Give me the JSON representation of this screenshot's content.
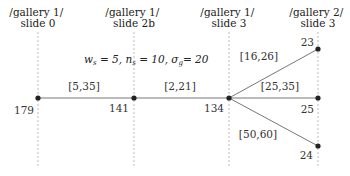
{
  "columns": [
    {
      "line1": "/gallery 1/",
      "line2": "slide 0",
      "x": 38
    },
    {
      "line1": "/gallery 1/",
      "line2": "slide 2b",
      "x": 134
    },
    {
      "line1": "/gallery 1/",
      "line2": "slide 3",
      "x": 229
    },
    {
      "line1": "/gallery 2/",
      "line2": "slide 3",
      "x": 318
    }
  ],
  "formula": {
    "w_sym": "w",
    "w_sub": "s",
    "w_val": " = 5, ",
    "n_sym": "n",
    "n_sub": "s",
    "n_val": " = 10, ",
    "sigma_sym": "σ",
    "sigma_sub": "g",
    "sigma_val": "= 20"
  },
  "nodes": [
    {
      "id": "n179",
      "label": "179",
      "x": 38,
      "y": 98
    },
    {
      "id": "n141",
      "label": "141",
      "x": 134,
      "y": 98
    },
    {
      "id": "n134",
      "label": "134",
      "x": 229,
      "y": 98
    },
    {
      "id": "n23",
      "label": "23",
      "x": 318,
      "y": 49
    },
    {
      "id": "n25",
      "label": "25",
      "x": 318,
      "y": 98
    },
    {
      "id": "n24",
      "label": "24",
      "x": 318,
      "y": 146
    }
  ],
  "edges": [
    {
      "from": "n179",
      "to": "n141",
      "label": "[5,35]"
    },
    {
      "from": "n141",
      "to": "n134",
      "label": "[2,21]"
    },
    {
      "from": "n134",
      "to": "n23",
      "label": "[16,26]"
    },
    {
      "from": "n134",
      "to": "n25",
      "label": "[25,35]"
    },
    {
      "from": "n134",
      "to": "n24",
      "label": "[50,60]"
    }
  ],
  "colors": {
    "line": "#777777",
    "dashed": "#aaaaaa",
    "node": "#222222",
    "text": "#222222"
  }
}
